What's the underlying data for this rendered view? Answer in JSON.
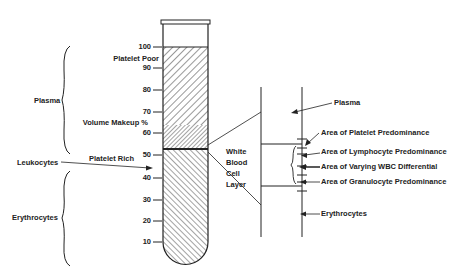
{
  "diagram": {
    "type": "blood-tube-separation",
    "tube": {
      "scale_label": "Volume Makeup %",
      "ticks": [
        "100",
        "90",
        "80",
        "70",
        "60",
        "50",
        "40",
        "30",
        "20",
        "10"
      ],
      "upper_label": "Platelet Poor",
      "lower_label": "Platelet Rich"
    },
    "left_groups": [
      {
        "label": "Plasma"
      },
      {
        "label": "Leukocytes"
      },
      {
        "label": "Erythrocytes"
      }
    ],
    "detail": {
      "wbc_label_lines": [
        "White",
        "Blood",
        "Cell",
        "Layer"
      ],
      "plasma_label": "Plasma",
      "erythrocytes_label": "Erythrocytes",
      "areas": [
        "Area of Platelet Predominance",
        "Area of Lymphocyte Predominance",
        "Area of Varying WBC Differential",
        "Area of Granulocyte Predominance"
      ]
    }
  }
}
